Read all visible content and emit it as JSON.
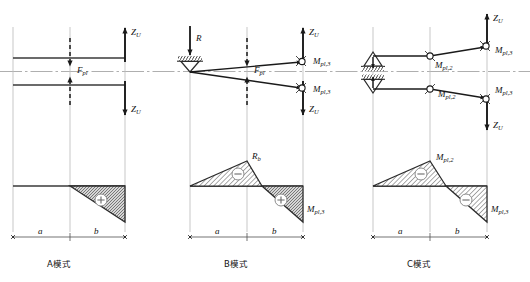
{
  "figure": {
    "type": "structural-mechanics-diagram",
    "width": 530,
    "height": 282,
    "colors": {
      "ink": "#1a1a1a",
      "guide": "#b9b9b9",
      "centerline": "#9a9a9a",
      "hatch": "#6d6d6d",
      "background": "#ffffff"
    }
  },
  "panels": [
    {
      "id": "A",
      "caption": "A模式",
      "x_left": 13,
      "x_mid": 70,
      "x_right": 125,
      "support_type": "none",
      "forces": [
        {
          "name": "F_pl",
          "label_base": "F",
          "label_sub": "pl",
          "style": "dashed",
          "direction": "inward",
          "x": 70
        },
        {
          "name": "Z_U_top",
          "label_base": "Z",
          "label_sub": "U",
          "style": "solid",
          "direction": "up",
          "x": 125
        },
        {
          "name": "Z_U_bottom",
          "label_base": "Z",
          "label_sub": "U",
          "style": "solid",
          "direction": "down",
          "x": 125
        }
      ],
      "hinges": [],
      "moment_diagram": {
        "shape": "right-triangle",
        "peak_at": "x_mid",
        "regions": [
          {
            "sign": "+",
            "symbol": "⊕",
            "from": "x_mid",
            "to": "x_right",
            "side": "below"
          }
        ],
        "labels": []
      },
      "dimensions": [
        {
          "label": "a",
          "from": 13,
          "to": 70
        },
        {
          "label": "b",
          "from": 70,
          "to": 125
        }
      ]
    },
    {
      "id": "B",
      "caption": "B模式",
      "x_left": 190,
      "x_mid": 247,
      "x_right": 303,
      "support_type": "single-pin-hinge",
      "forces": [
        {
          "name": "R",
          "label_base": "R",
          "label_sub": "",
          "style": "solid",
          "direction": "down",
          "x": 190
        },
        {
          "name": "F_pl",
          "label_base": "F",
          "label_sub": "pl",
          "style": "dashed",
          "direction": "inward",
          "x": 247
        },
        {
          "name": "Z_U_top",
          "label_base": "Z",
          "label_sub": "U",
          "style": "solid",
          "direction": "up",
          "x": 303
        },
        {
          "name": "Z_U_bottom",
          "label_base": "Z",
          "label_sub": "U",
          "style": "solid",
          "direction": "down",
          "x": 303
        }
      ],
      "hinges": [
        {
          "name": "plastic-hinge-top-right",
          "label_base": "M",
          "label_sub": "pl,3",
          "x": 303,
          "y": "upper"
        },
        {
          "name": "plastic-hinge-bottom-right",
          "label_base": "M",
          "label_sub": "pl,3",
          "x": 303,
          "y": "lower"
        }
      ],
      "moment_diagram": {
        "shape": "peak-then-drop",
        "peak_at": "x_mid",
        "regions": [
          {
            "sign": "-",
            "symbol": "⊖",
            "from": "x_left",
            "to": "x_mid",
            "side": "above"
          },
          {
            "sign": "+",
            "symbol": "⊕",
            "from": "x_mid",
            "to": "x_right",
            "side": "below"
          }
        ],
        "labels": [
          {
            "name": "peak-label",
            "label_base": "R",
            "label_sub": "b",
            "at": "peak"
          },
          {
            "name": "end-label",
            "label_base": "M",
            "label_sub": "pl,3",
            "at": "right-end"
          }
        ]
      },
      "dimensions": [
        {
          "label": "a",
          "from": 190,
          "to": 247
        },
        {
          "label": "b",
          "from": 247,
          "to": 303
        }
      ]
    },
    {
      "id": "C",
      "caption": "C模式",
      "x_left": 373,
      "x_mid": 430,
      "x_right": 487,
      "support_type": "double-pin-hinge",
      "forces": [
        {
          "name": "Z_U_top",
          "label_base": "Z",
          "label_sub": "U",
          "style": "solid",
          "direction": "up",
          "x": 487
        },
        {
          "name": "Z_U_bottom",
          "label_base": "Z",
          "label_sub": "U",
          "style": "solid",
          "direction": "down",
          "x": 487
        }
      ],
      "hinges": [
        {
          "name": "plastic-hinge-top-mid",
          "label_base": "M",
          "label_sub": "pl,2",
          "x": 430,
          "y": "upper"
        },
        {
          "name": "plastic-hinge-bottom-mid",
          "label_base": "M",
          "label_sub": "pl,2",
          "x": 430,
          "y": "lower"
        },
        {
          "name": "plastic-hinge-top-right",
          "label_base": "M",
          "label_sub": "pl,3",
          "x": 487,
          "y": "upper"
        },
        {
          "name": "plastic-hinge-bottom-right",
          "label_base": "M",
          "label_sub": "pl,3",
          "x": 487,
          "y": "lower"
        }
      ],
      "moment_diagram": {
        "shape": "peak-then-drop",
        "peak_at": "x_mid",
        "regions": [
          {
            "sign": "-",
            "symbol": "⊖",
            "from": "x_left",
            "to": "x_mid",
            "side": "above"
          },
          {
            "sign": "-",
            "symbol": "⊖",
            "from": "x_mid",
            "to": "x_right",
            "side": "below"
          }
        ],
        "labels": [
          {
            "name": "peak-label",
            "label_base": "M",
            "label_sub": "pl,2",
            "at": "peak"
          },
          {
            "name": "end-label",
            "label_base": "M",
            "label_sub": "pl,3",
            "at": "right-end"
          }
        ]
      },
      "dimensions": [
        {
          "label": "a",
          "from": 373,
          "to": 430
        },
        {
          "label": "b",
          "from": 430,
          "to": 487
        }
      ]
    }
  ],
  "captions": {
    "a": "A模式",
    "b": "B模式",
    "c": "C模式"
  }
}
